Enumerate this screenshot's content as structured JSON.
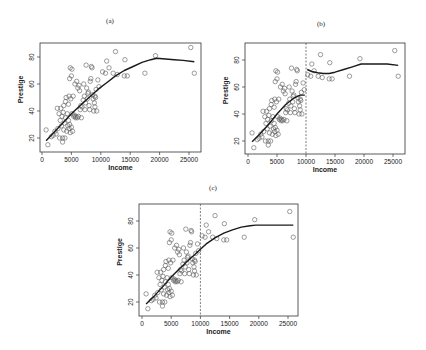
{
  "figure": {
    "panels": [
      {
        "id": "a",
        "title": "(a)",
        "xlabel": "Income",
        "ylabel": "Prestige",
        "dashed_x": null,
        "box": {
          "x0": 40,
          "y0": 43,
          "x1": 201,
          "y1": 152
        },
        "xmap": {
          "v0": 0,
          "p0": 42,
          "v1": 25000,
          "p1": 189
        },
        "ymap": {
          "v0": 20,
          "p0": 138,
          "v1": 80,
          "p1": 57
        },
        "title_pos": {
          "x": 110,
          "y": 17
        }
      },
      {
        "id": "b",
        "title": "(b)",
        "xlabel": "Income",
        "ylabel": "Prestige",
        "dashed_x": 10000,
        "box": {
          "x0": 245,
          "y0": 43,
          "x1": 405,
          "y1": 154
        },
        "xmap": {
          "v0": 0,
          "p0": 248,
          "v1": 25000,
          "p1": 393
        },
        "ymap": {
          "v0": 20,
          "p0": 141,
          "v1": 80,
          "p1": 60
        },
        "title_pos": {
          "x": 321,
          "y": 20
        }
      },
      {
        "id": "c",
        "title": "(c)",
        "xlabel": "Income",
        "ylabel": "Prestige",
        "dashed_x": 10000,
        "box": {
          "x0": 139,
          "y0": 204,
          "x1": 298,
          "y1": 316
        },
        "xmap": {
          "v0": 0,
          "p0": 142,
          "v1": 25000,
          "p1": 288
        },
        "ymap": {
          "v0": 20,
          "p0": 302,
          "v1": 80,
          "p1": 221
        },
        "title_pos": {
          "x": 213,
          "y": 184
        }
      }
    ]
  },
  "chart_data": [
    {
      "type": "scatter",
      "title": "(a)",
      "xlabel": "Income",
      "ylabel": "Prestige",
      "xlim": [
        0,
        26000
      ],
      "ylim": [
        13,
        88
      ],
      "xticks": [
        0,
        5000,
        10000,
        15000,
        20000,
        25000
      ],
      "yticks": [
        20,
        40,
        60,
        80
      ],
      "grid": false,
      "series": [
        {
          "name": "occupations",
          "marker": "open-circle",
          "ref": "points"
        },
        {
          "name": "global smooth fit",
          "type": "line",
          "x": [
            700,
            2000,
            3500,
            5000,
            6500,
            8000,
            9500,
            11000,
            12500,
            14000,
            15500,
            17000,
            18500,
            19500,
            21000,
            22500,
            24000,
            25900
          ],
          "y": [
            18,
            24,
            31,
            38,
            44,
            50,
            56,
            61,
            66,
            70,
            73,
            76,
            78,
            79,
            78.5,
            78,
            77.5,
            76.5
          ]
        }
      ]
    },
    {
      "type": "scatter",
      "title": "(b)",
      "xlabel": "Income",
      "ylabel": "Prestige",
      "xlim": [
        0,
        26000
      ],
      "ylim": [
        13,
        88
      ],
      "xticks": [
        0,
        5000,
        10000,
        15000,
        20000,
        25000
      ],
      "yticks": [
        20,
        40,
        60,
        80
      ],
      "grid": false,
      "annotations": [
        {
          "type": "vline",
          "x": 10000,
          "style": "dashed"
        }
      ],
      "series": [
        {
          "name": "occupations",
          "marker": "open-circle",
          "ref": "points"
        },
        {
          "name": "local fit (income < 10000)",
          "type": "line",
          "x": [
            700,
            2000,
            3500,
            5000,
            6500,
            8000,
            9000,
            9800
          ],
          "y": [
            19.5,
            25,
            32,
            40,
            47,
            52,
            54,
            54
          ]
        },
        {
          "name": "local fit (income > 10000)",
          "type": "line",
          "x": [
            10200,
            11000,
            12000,
            13000,
            14000,
            15000,
            16500,
            18000,
            19500,
            21000,
            22500,
            24000,
            25900
          ],
          "y": [
            73,
            71.5,
            70.5,
            70,
            70,
            71,
            73,
            75,
            77,
            77,
            77,
            77,
            76
          ]
        }
      ]
    },
    {
      "type": "scatter",
      "title": "(c)",
      "xlabel": "Income",
      "ylabel": "Prestige",
      "xlim": [
        0,
        26000
      ],
      "ylim": [
        13,
        88
      ],
      "xticks": [
        0,
        5000,
        10000,
        15000,
        20000,
        25000
      ],
      "yticks": [
        20,
        40,
        60,
        80
      ],
      "grid": false,
      "annotations": [
        {
          "type": "vline",
          "x": 10000,
          "style": "dashed"
        }
      ],
      "series": [
        {
          "name": "occupations",
          "marker": "open-circle",
          "ref": "points"
        },
        {
          "name": "smooth fit (continuous at 10000)",
          "type": "line",
          "x": [
            700,
            2000,
            3500,
            5000,
            6500,
            8000,
            9000,
            10000,
            11000,
            12500,
            14000,
            15500,
            17000,
            18500,
            19500,
            21000,
            23000,
            25900
          ],
          "y": [
            18.5,
            24,
            31,
            38.5,
            45,
            51,
            55,
            59,
            63,
            67.5,
            71,
            73.5,
            75.5,
            76.5,
            77,
            77,
            77,
            77
          ]
        }
      ]
    }
  ],
  "points": [
    [
      700,
      26
    ],
    [
      1000,
      15
    ],
    [
      1600,
      21
    ],
    [
      1900,
      22
    ],
    [
      2200,
      25
    ],
    [
      2400,
      23
    ],
    [
      2600,
      42
    ],
    [
      2700,
      27
    ],
    [
      2900,
      38
    ],
    [
      3000,
      20
    ],
    [
      3100,
      33
    ],
    [
      3200,
      42
    ],
    [
      3300,
      29
    ],
    [
      3400,
      36
    ],
    [
      3500,
      17
    ],
    [
      3500,
      20
    ],
    [
      3600,
      39
    ],
    [
      3700,
      44
    ],
    [
      3700,
      26
    ],
    [
      3800,
      31
    ],
    [
      3900,
      20
    ],
    [
      4000,
      35
    ],
    [
      4000,
      47
    ],
    [
      4100,
      50
    ],
    [
      4200,
      25
    ],
    [
      4300,
      38
    ],
    [
      4400,
      29
    ],
    [
      4500,
      45
    ],
    [
      4500,
      33
    ],
    [
      4600,
      27
    ],
    [
      4600,
      51
    ],
    [
      4700,
      30
    ],
    [
      4700,
      64
    ],
    [
      4800,
      72
    ],
    [
      4800,
      24
    ],
    [
      4900,
      49
    ],
    [
      5000,
      28
    ],
    [
      5000,
      66
    ],
    [
      5100,
      38
    ],
    [
      5100,
      71
    ],
    [
      5200,
      25
    ],
    [
      5300,
      51
    ],
    [
      5400,
      36
    ],
    [
      5500,
      37
    ],
    [
      5600,
      60
    ],
    [
      5700,
      35
    ],
    [
      5800,
      36
    ],
    [
      5900,
      62
    ],
    [
      6000,
      35
    ],
    [
      6100,
      57
    ],
    [
      6200,
      36
    ],
    [
      6300,
      59
    ],
    [
      6400,
      55
    ],
    [
      6500,
      41
    ],
    [
      6600,
      44
    ],
    [
      6700,
      35
    ],
    [
      6800,
      43
    ],
    [
      7000,
      48
    ],
    [
      7100,
      60
    ],
    [
      7200,
      51
    ],
    [
      7300,
      41
    ],
    [
      7400,
      46
    ],
    [
      7500,
      74
    ],
    [
      7600,
      57
    ],
    [
      7700,
      49
    ],
    [
      7800,
      53
    ],
    [
      7900,
      54
    ],
    [
      8000,
      44
    ],
    [
      8100,
      41
    ],
    [
      8200,
      62
    ],
    [
      8300,
      64
    ],
    [
      8400,
      73
    ],
    [
      8500,
      72
    ],
    [
      8600,
      52
    ],
    [
      8700,
      49
    ],
    [
      8800,
      40
    ],
    [
      8900,
      46
    ],
    [
      9000,
      51
    ],
    [
      9000,
      43
    ],
    [
      9100,
      50
    ],
    [
      9200,
      56
    ],
    [
      9300,
      40
    ],
    [
      9500,
      63
    ],
    [
      9700,
      58
    ],
    [
      10300,
      69
    ],
    [
      10800,
      68
    ],
    [
      11000,
      77
    ],
    [
      11400,
      72
    ],
    [
      12100,
      68
    ],
    [
      12500,
      84
    ],
    [
      12800,
      67
    ],
    [
      14000,
      66
    ],
    [
      14100,
      78
    ],
    [
      14500,
      66
    ],
    [
      17500,
      68
    ],
    [
      19300,
      81
    ],
    [
      25300,
      87
    ],
    [
      25900,
      68
    ]
  ],
  "style": {
    "point_color": "#5a5a5a",
    "line_color": "#1a1a1a",
    "axis_color": "#333333",
    "background": "#ffffff"
  }
}
